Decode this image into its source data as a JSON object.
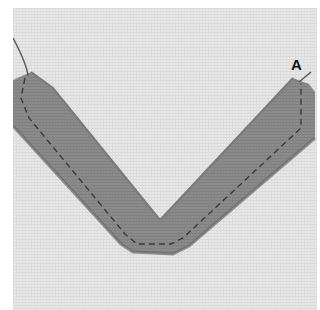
{
  "image": {
    "description": "Photo of a grey fabric bias-tape strip folded into a V shape, basted onto light linen fabric with a dashed running stitch",
    "label": "A",
    "colors": {
      "background_linen": "#e6e6e6",
      "strip": "#8a8a8a",
      "strip_shadow": "#6f6f6f",
      "stitch": "#3a3a3a",
      "thread": "#5a5a5a",
      "border": "#ffffff"
    }
  }
}
